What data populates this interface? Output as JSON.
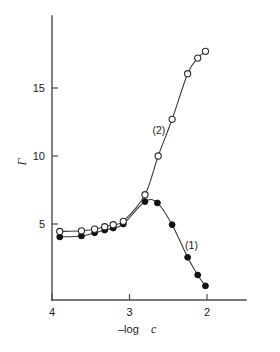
{
  "figure": {
    "background_color": "#ffffff",
    "ink_color": "#2b2b2b"
  },
  "chart_data": {
    "type": "line",
    "title": "",
    "subtitle": "",
    "xlabel": "–log c",
    "ylabel": "Γ",
    "xlabel_parts": {
      "prefix": "–log",
      "variable": "c"
    },
    "xlim": [
      4.0,
      1.75
    ],
    "ylim": [
      0,
      19.3
    ],
    "x_inverted": true,
    "xticks": [
      "4",
      "3",
      "2"
    ],
    "xtick_values": [
      4,
      3,
      2
    ],
    "yticks": [
      "5",
      "10",
      "15"
    ],
    "ytick_values": [
      5,
      10,
      15
    ],
    "grid": false,
    "legend": "inline-annotations",
    "annotations": [
      {
        "text": "(1)",
        "x": 2.2,
        "y": 3.2,
        "for_series": "1"
      },
      {
        "text": "(2)",
        "x": 2.62,
        "y": 11.6,
        "for_series": "2"
      }
    ],
    "series": [
      {
        "name": "(1)",
        "marker": "filled-circle",
        "marker_style": "closed",
        "points": [
          {
            "x": 3.9,
            "y": 4.05
          },
          {
            "x": 3.62,
            "y": 4.12
          },
          {
            "x": 3.45,
            "y": 4.35
          },
          {
            "x": 3.32,
            "y": 4.55
          },
          {
            "x": 3.21,
            "y": 4.7
          },
          {
            "x": 3.08,
            "y": 5.0
          },
          {
            "x": 2.8,
            "y": 6.65
          },
          {
            "x": 2.64,
            "y": 6.55
          },
          {
            "x": 2.45,
            "y": 4.95
          },
          {
            "x": 2.25,
            "y": 2.55
          },
          {
            "x": 2.12,
            "y": 1.25
          },
          {
            "x": 2.02,
            "y": 0.45
          }
        ]
      },
      {
        "name": "(2)",
        "marker": "open-circle",
        "marker_style": "open",
        "points": [
          {
            "x": 3.9,
            "y": 4.45
          },
          {
            "x": 3.62,
            "y": 4.5
          },
          {
            "x": 3.45,
            "y": 4.62
          },
          {
            "x": 3.32,
            "y": 4.8
          },
          {
            "x": 3.21,
            "y": 4.95
          },
          {
            "x": 3.08,
            "y": 5.2
          },
          {
            "x": 2.8,
            "y": 7.15
          },
          {
            "x": 2.63,
            "y": 10.0
          },
          {
            "x": 2.45,
            "y": 12.7
          },
          {
            "x": 2.25,
            "y": 16.05
          },
          {
            "x": 2.12,
            "y": 17.2
          },
          {
            "x": 2.02,
            "y": 17.7
          }
        ]
      }
    ]
  }
}
